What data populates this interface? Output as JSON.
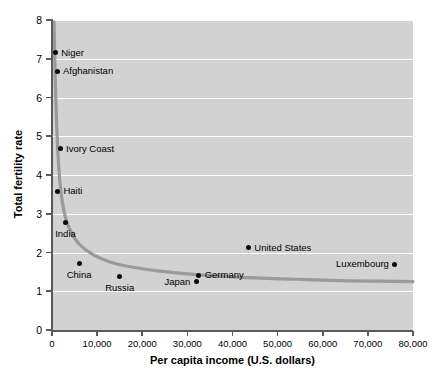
{
  "chart_data": {
    "type": "scatter",
    "title": "",
    "xlabel": "Per capita income (U.S. dollars)",
    "ylabel": "Total fertility rate",
    "xlim": [
      0,
      80000
    ],
    "ylim": [
      0,
      8
    ],
    "grid": true,
    "legend": "none",
    "xticks": [
      "0",
      "10,000",
      "20,000",
      "30,000",
      "40,000",
      "50,000",
      "60,000",
      "70,000",
      "80,000"
    ],
    "xtick_values": [
      0,
      10000,
      20000,
      30000,
      40000,
      50000,
      60000,
      70000,
      80000
    ],
    "yticks": [
      "0",
      "1",
      "2",
      "3",
      "4",
      "5",
      "6",
      "7",
      "8"
    ],
    "ytick_values": [
      0,
      1,
      2,
      3,
      4,
      5,
      6,
      7,
      8
    ],
    "points": [
      {
        "label": "Niger",
        "x": 700,
        "y": 7.15,
        "label_pos": "right"
      },
      {
        "label": "Afghanistan",
        "x": 1100,
        "y": 6.68,
        "label_pos": "right"
      },
      {
        "label": "Ivory Coast",
        "x": 1800,
        "y": 4.68,
        "label_pos": "right"
      },
      {
        "label": "Haiti",
        "x": 1200,
        "y": 3.58,
        "label_pos": "right"
      },
      {
        "label": "India",
        "x": 3000,
        "y": 2.78,
        "label_pos": "below"
      },
      {
        "label": "China",
        "x": 6000,
        "y": 1.72,
        "label_pos": "below"
      },
      {
        "label": "Russia",
        "x": 15000,
        "y": 1.39,
        "label_pos": "below"
      },
      {
        "label": "Japan",
        "x": 32000,
        "y": 1.25,
        "label_pos": "left"
      },
      {
        "label": "Germany",
        "x": 32500,
        "y": 1.42,
        "label_pos": "right"
      },
      {
        "label": "United States",
        "x": 43500,
        "y": 2.12,
        "label_pos": "right"
      },
      {
        "label": "Luxembourg",
        "x": 76000,
        "y": 1.7,
        "label_pos": "left"
      }
    ],
    "trend_curve": {
      "description": "smooth decreasing fitted curve",
      "color": "#9a9a9a",
      "width": 3.2,
      "points": [
        {
          "x": 450,
          "y": 7.95
        },
        {
          "x": 600,
          "y": 7.1
        },
        {
          "x": 800,
          "y": 6.1
        },
        {
          "x": 1100,
          "y": 5.1
        },
        {
          "x": 1500,
          "y": 4.2
        },
        {
          "x": 2000,
          "y": 3.55
        },
        {
          "x": 2800,
          "y": 3.0
        },
        {
          "x": 4000,
          "y": 2.58
        },
        {
          "x": 6000,
          "y": 2.22
        },
        {
          "x": 9000,
          "y": 1.95
        },
        {
          "x": 13000,
          "y": 1.75
        },
        {
          "x": 18000,
          "y": 1.62
        },
        {
          "x": 24000,
          "y": 1.52
        },
        {
          "x": 32000,
          "y": 1.43
        },
        {
          "x": 42000,
          "y": 1.36
        },
        {
          "x": 54000,
          "y": 1.31
        },
        {
          "x": 66000,
          "y": 1.27
        },
        {
          "x": 80000,
          "y": 1.25
        }
      ]
    },
    "colors": {
      "panel_background": "#d2d2d2",
      "gridline": "#ffffff",
      "axis": "#5a5a5a",
      "marker": "#0b0b0b",
      "curve": "#9a9a9a",
      "text": "#000000"
    }
  }
}
